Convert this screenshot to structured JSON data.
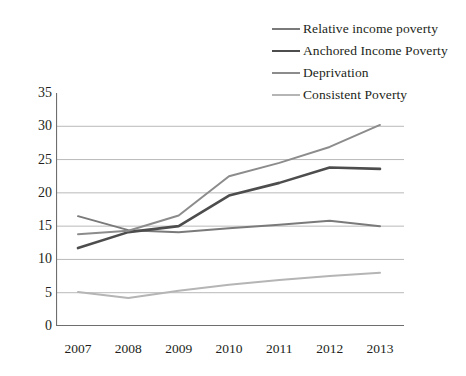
{
  "chart_data": {
    "type": "line",
    "title": "",
    "xlabel": "",
    "ylabel": "",
    "categories": [
      "2007",
      "2008",
      "2009",
      "2010",
      "2011",
      "2012",
      "2013"
    ],
    "ylim": [
      0,
      35
    ],
    "ytick_step": 5,
    "yticks": [
      "0",
      "5",
      "10",
      "15",
      "20",
      "25",
      "30",
      "35"
    ],
    "grid": "horizontal",
    "legend_position": "top-right",
    "series": [
      {
        "name": "Relative income poverty",
        "color": "#7a7a7a",
        "values": [
          16.5,
          14.4,
          14.1,
          14.7,
          15.2,
          15.8,
          15.0
        ]
      },
      {
        "name": "Anchored Income Poverty",
        "color": "#4d4d4d",
        "values": [
          11.7,
          14.1,
          15.0,
          19.6,
          21.5,
          23.8,
          23.6
        ]
      },
      {
        "name": "Deprivation",
        "color": "#8c8c8c",
        "values": [
          13.8,
          14.3,
          16.6,
          22.5,
          24.5,
          26.9,
          30.2
        ]
      },
      {
        "name": "Consistent Poverty",
        "color": "#b5b5b5",
        "values": [
          5.1,
          4.2,
          5.3,
          6.2,
          6.9,
          7.5,
          8.0
        ]
      }
    ]
  },
  "legend": {
    "items": [
      {
        "label": "Relative income poverty"
      },
      {
        "label": "Anchored Income Poverty"
      },
      {
        "label": "Deprivation"
      },
      {
        "label": "Consistent Poverty"
      }
    ]
  },
  "colors": {
    "grid": "#b9b9b9",
    "axis": "#6e6e6e",
    "text": "#231f20",
    "background": "#ffffff"
  }
}
